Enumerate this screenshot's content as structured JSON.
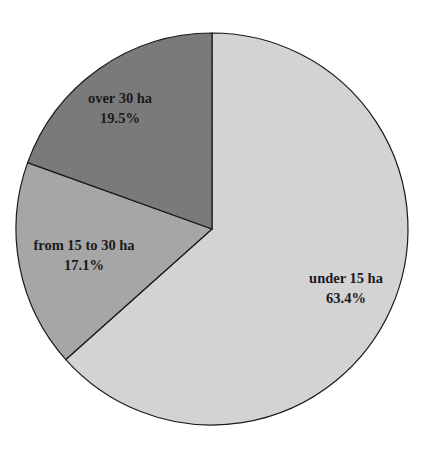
{
  "chart_data": {
    "type": "pie",
    "title": "",
    "categories": [
      "under 15 ha",
      "from 15 to 30 ha",
      "over 30 ha"
    ],
    "values": [
      63.4,
      17.1,
      19.5
    ],
    "value_labels": [
      "63.4%",
      "17.1%",
      "19.5%"
    ],
    "colors": [
      "#d3d3d3",
      "#a6a6a6",
      "#7a7a7a"
    ],
    "start_angle_deg": 0,
    "direction": "clockwise",
    "legend": "none",
    "slices": [
      {
        "label": "under 15 ha",
        "value": 63.4,
        "text": "63.4%",
        "color": "#d3d3d3"
      },
      {
        "label": "from 15 to 30 ha",
        "value": 17.1,
        "text": "17.1%",
        "color": "#a6a6a6"
      },
      {
        "label": "over 30 ha",
        "value": 19.5,
        "text": "19.5%",
        "color": "#7a7a7a"
      }
    ]
  }
}
